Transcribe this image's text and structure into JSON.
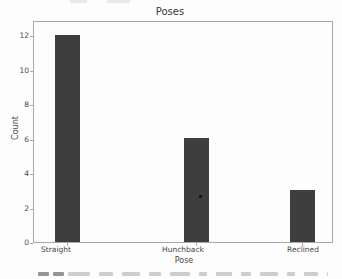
{
  "chart_data": {
    "type": "bar",
    "title": "Poses",
    "xlabel": "Pose",
    "ylabel": "Count",
    "categories": [
      "Straight",
      "Hunchback",
      "Reclined"
    ],
    "values": [
      12,
      6,
      3
    ],
    "yticks": [
      0,
      2,
      4,
      6,
      8,
      10,
      12
    ],
    "ylim": [
      0,
      12.9
    ],
    "grid": false,
    "legend": "none",
    "colors": {
      "bar": "#3e3e3e",
      "spine": "#a8a8a8",
      "text": "#474747",
      "background": "#fdfdfd"
    }
  }
}
